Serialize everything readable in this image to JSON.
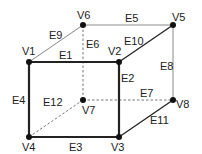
{
  "diagram": {
    "type": "cube-graph",
    "vertices": [
      {
        "id": "V1",
        "label": "V1",
        "x": 29,
        "y": 62,
        "lx": 22,
        "ly": 55
      },
      {
        "id": "V2",
        "label": "V2",
        "x": 119,
        "y": 62,
        "lx": 108,
        "ly": 55
      },
      {
        "id": "V3",
        "label": "V3",
        "x": 119,
        "y": 137,
        "lx": 111,
        "ly": 151
      },
      {
        "id": "V4",
        "label": "V4",
        "x": 29,
        "y": 137,
        "lx": 22,
        "ly": 151
      },
      {
        "id": "V5",
        "label": "V5",
        "x": 173,
        "y": 25,
        "lx": 172,
        "ly": 21
      },
      {
        "id": "V6",
        "label": "V6",
        "x": 83,
        "y": 25,
        "lx": 77,
        "ly": 19
      },
      {
        "id": "V7",
        "label": "V7",
        "x": 83,
        "y": 100,
        "lx": 82,
        "ly": 114
      },
      {
        "id": "V8",
        "label": "V8",
        "x": 173,
        "y": 100,
        "lx": 176,
        "ly": 108
      }
    ],
    "edges": [
      {
        "id": "E1",
        "label": "E1",
        "from": "V1",
        "to": "V2",
        "style": "thick",
        "lx": 59,
        "ly": 59
      },
      {
        "id": "E2",
        "label": "E2",
        "from": "V2",
        "to": "V3",
        "style": "thick",
        "lx": 121,
        "ly": 82
      },
      {
        "id": "E3",
        "label": "E3",
        "from": "V4",
        "to": "V3",
        "style": "thick",
        "lx": 69,
        "ly": 151
      },
      {
        "id": "E4",
        "label": "E4",
        "from": "V1",
        "to": "V4",
        "style": "thick",
        "lx": 12,
        "ly": 104
      },
      {
        "id": "E5",
        "label": "E5",
        "from": "V6",
        "to": "V5",
        "style": "thin",
        "lx": 125,
        "ly": 22
      },
      {
        "id": "E6",
        "label": "E6",
        "from": "V6",
        "to": "V7",
        "style": "dashed",
        "lx": 86,
        "ly": 48
      },
      {
        "id": "E7",
        "label": "E7",
        "from": "V7",
        "to": "V8",
        "style": "dashed",
        "lx": 140,
        "ly": 97
      },
      {
        "id": "E8",
        "label": "E8",
        "from": "V5",
        "to": "V8",
        "style": "thin",
        "lx": 160,
        "ly": 70
      },
      {
        "id": "E9",
        "label": "E9",
        "from": "V1",
        "to": "V6",
        "style": "thin",
        "lx": 49,
        "ly": 39
      },
      {
        "id": "E10",
        "label": "E10",
        "from": "V2",
        "to": "V5",
        "style": "medium",
        "lx": 124,
        "ly": 45
      },
      {
        "id": "E11",
        "label": "E11",
        "from": "V3",
        "to": "V8",
        "style": "medium",
        "lx": 150,
        "ly": 124
      },
      {
        "id": "E12",
        "label": "E12",
        "from": "V4",
        "to": "V7",
        "style": "dashed",
        "lx": 43,
        "ly": 106
      }
    ],
    "colors": {
      "line": "#222222",
      "thin_line": "#888888",
      "dashed_line": "#777777",
      "vertex": "#111111",
      "background": "#ffffff"
    }
  }
}
